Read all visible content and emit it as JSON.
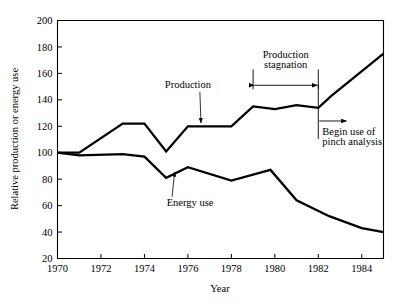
{
  "chart_data": {
    "type": "line",
    "title": "",
    "xlabel": "Year",
    "ylabel": "Relative production or energy use",
    "xlim": [
      1970,
      1985
    ],
    "ylim": [
      20,
      200
    ],
    "xticks": [
      1970,
      1972,
      1974,
      1976,
      1978,
      1980,
      1982,
      1984
    ],
    "xtick_labels": [
      "1970",
      "1972",
      "1974",
      "1976",
      "1978",
      "1980",
      "1982",
      "1984"
    ],
    "yticks": [
      20,
      40,
      60,
      80,
      100,
      120,
      140,
      160,
      180,
      200
    ],
    "ytick_labels": [
      "20",
      "40",
      "60",
      "80",
      "100",
      "120",
      "140",
      "160",
      "180",
      "200"
    ],
    "grid": false,
    "legend": "inline-labels",
    "series": [
      {
        "name": "Production",
        "x": [
          1970.0,
          1971.0,
          1973.0,
          1974.0,
          1975.0,
          1976.0,
          1978.0,
          1979.0,
          1980.0,
          1981.0,
          1982.0,
          1982.6,
          1985.0
        ],
        "values": [
          100,
          100,
          122,
          122,
          101,
          120,
          120,
          135,
          133,
          136,
          134,
          143,
          175
        ]
      },
      {
        "name": "Energy use",
        "x": [
          1970.0,
          1971.0,
          1973.0,
          1974.0,
          1975.0,
          1976.0,
          1978.0,
          1979.8,
          1981.0,
          1982.5,
          1984.0,
          1985.0
        ],
        "values": [
          100,
          98,
          99,
          97,
          81,
          89,
          79,
          87,
          64,
          52,
          43,
          40
        ]
      }
    ],
    "annotations": [
      {
        "name": "production-label",
        "text": "Production",
        "x": 1976.0,
        "y": 149,
        "leader_to_x": 1976.6,
        "leader_to_y": 121
      },
      {
        "name": "energy-use-label",
        "text": "Energy use",
        "x": 1976.1,
        "y": 60,
        "leader_to_x": 1975.3,
        "leader_to_y": 84
      },
      {
        "name": "production-stagnation-label",
        "text_line1": "Production",
        "text_line2": "stagnation",
        "bracket_x_start": 1979.0,
        "bracket_x_end": 1982.0,
        "bracket_y": 151,
        "bracket_top_y": 163
      },
      {
        "name": "begin-pinch-analysis-label",
        "text_line1": "Begin use of",
        "text_line2": "pinch analysis",
        "marker_x": 1982.0,
        "arrow_y": 124,
        "arrow_to_x": 1983.3
      }
    ]
  },
  "colors": {
    "line": "#000000",
    "axis": "#000000",
    "background": "#ffffff"
  }
}
